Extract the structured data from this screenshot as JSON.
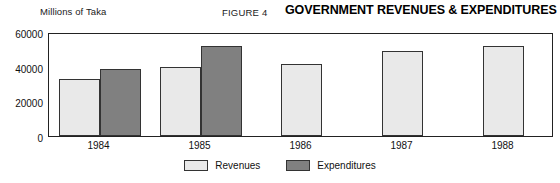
{
  "header": {
    "axis_unit_label": "Millions of Taka",
    "figure_number": "FIGURE 4",
    "title": "GOVERNMENT REVENUES & EXPENDITURES"
  },
  "colors": {
    "revenues_fill": "#e9e9e9",
    "expenditures_fill": "#808080",
    "outline": "#333333",
    "frame": "#222222",
    "background": "#ffffff"
  },
  "chart_data": {
    "type": "bar",
    "title": "GOVERNMENT REVENUES & EXPENDITURES",
    "subtitle": "FIGURE 4",
    "xlabel": "",
    "ylabel": "Millions of Taka",
    "categories": [
      "1984",
      "1985",
      "1986",
      "1987",
      "1988"
    ],
    "ylim": [
      0,
      60000
    ],
    "yticks": [
      0,
      20000,
      40000,
      60000
    ],
    "ytick_labels": [
      "0",
      "20000",
      "40000",
      "60000"
    ],
    "grid": false,
    "legend_position": "bottom-center",
    "series": [
      {
        "name": "Revenues",
        "color": "#e9e9e9",
        "values": [
          33000,
          40000,
          41500,
          49000,
          52000
        ]
      },
      {
        "name": "Expenditures",
        "color": "#808080",
        "values": [
          38500,
          52000,
          null,
          null,
          null
        ]
      }
    ]
  }
}
